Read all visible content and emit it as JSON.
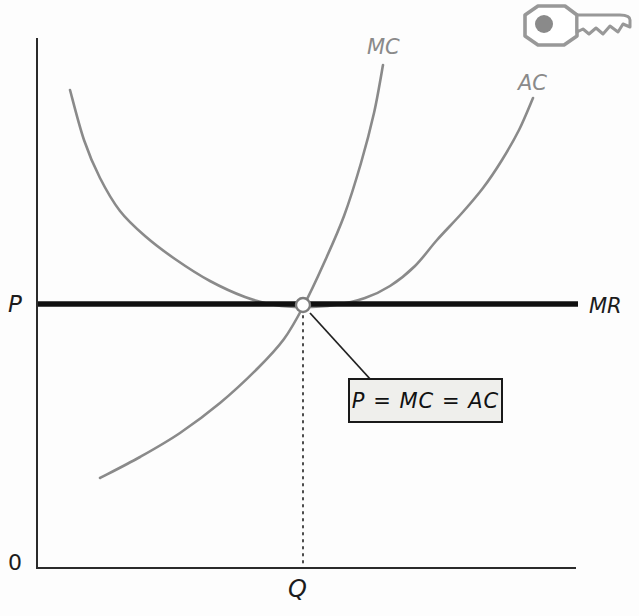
{
  "figure": {
    "labels": {
      "mc": "MC",
      "ac": "AC",
      "mr": "MR",
      "price_axis": "P",
      "origin": "0",
      "quantity": "Q"
    },
    "annotation_text": "P = MC = AC",
    "icons": {
      "key": "key-icon"
    },
    "colors": {
      "curve_gray": "#8a8a8a",
      "mr_black": "#101010",
      "axis": "#2b2b2b",
      "dotted": "#4a4a4a",
      "pointer": "#222222",
      "marker_fill": "#ffffff",
      "marker_stroke": "#7d7d7d",
      "box_fill": "#efefec",
      "box_border": "#1a1a1a",
      "key_outline": "#989898",
      "key_dot": "#8a8a8a"
    }
  },
  "chart_data": {
    "type": "line",
    "xlabel": "Q",
    "ylabel": "P",
    "origin_label": "0",
    "axes_qualitative": true,
    "grid": false,
    "legend": "labels drawn at curve ends",
    "series": [
      {
        "name": "MC",
        "color": "#8a8a8a",
        "width": 2.6,
        "points_px": [
          [
            100,
            478
          ],
          [
            140,
            457
          ],
          [
            180,
            433
          ],
          [
            220,
            403
          ],
          [
            258,
            368
          ],
          [
            284,
            339
          ],
          [
            303,
            307
          ],
          [
            324,
            263
          ],
          [
            344,
            216
          ],
          [
            361,
            163
          ],
          [
            374,
            113
          ],
          [
            383,
            65
          ]
        ]
      },
      {
        "name": "AC",
        "color": "#8a8a8a",
        "width": 2.6,
        "points_px": [
          [
            70,
            90
          ],
          [
            84,
            140
          ],
          [
            100,
            178
          ],
          [
            120,
            211
          ],
          [
            145,
            236
          ],
          [
            175,
            259
          ],
          [
            210,
            281
          ],
          [
            245,
            297
          ],
          [
            275,
            305
          ],
          [
            303,
            307
          ],
          [
            335,
            305
          ],
          [
            365,
            298
          ],
          [
            390,
            286
          ],
          [
            415,
            266
          ],
          [
            437,
            240
          ],
          [
            462,
            213
          ],
          [
            483,
            188
          ],
          [
            502,
            160
          ],
          [
            519,
            130
          ],
          [
            533,
            98
          ]
        ]
      },
      {
        "name": "MR",
        "color": "#101010",
        "width": 5.5,
        "straight": true,
        "points_px": [
          [
            38,
            304
          ],
          [
            578,
            304
          ]
        ]
      }
    ],
    "equilibrium_point_px": [
      303,
      305
    ],
    "equilibrium_marker_radius": 7,
    "plot_box_px": {
      "origin": [
        37,
        568
      ],
      "x_end": 576,
      "y_top": 38
    },
    "annotations": [
      {
        "text": "P = MC = AC",
        "pointer_from_px": [
          310,
          313
        ],
        "pointer_to_px": [
          371,
          380
        ]
      }
    ]
  }
}
